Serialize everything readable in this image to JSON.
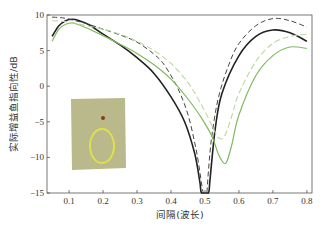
{
  "chart_data": {
    "type": "line",
    "title": "",
    "xlabel": "间隔(波长)",
    "ylabel": "实际增益鱼指向性/dB",
    "xlim": [
      0.035,
      0.815
    ],
    "ylim": [
      -15,
      10
    ],
    "xticks": [
      0.1,
      0.2,
      0.3,
      0.4,
      0.5,
      0.6,
      0.7,
      0.8
    ],
    "xtick_labels": [
      "0.1",
      "0.2",
      "0.3",
      "0.4",
      "0.5",
      "0.6",
      "0.7",
      "0.8"
    ],
    "yticks": [
      10,
      5,
      0,
      -5,
      -10,
      -15
    ],
    "ytick_labels": [
      "10",
      "5",
      "0",
      "−5",
      "−10",
      "−15"
    ],
    "grid": false,
    "legend": null,
    "series": [
      {
        "name": "black-solid",
        "color": "#222222",
        "dash": "",
        "width": 1.6,
        "x": [
          0.05,
          0.07,
          0.09,
          0.11,
          0.13,
          0.16,
          0.2,
          0.25,
          0.3,
          0.35,
          0.4,
          0.44,
          0.47,
          0.485,
          0.49,
          0.51,
          0.515,
          0.53,
          0.55,
          0.6,
          0.65,
          0.7,
          0.75,
          0.8
        ],
        "y": [
          7.0,
          8.5,
          9.2,
          9.4,
          9.2,
          8.6,
          7.3,
          5.8,
          4.0,
          1.8,
          -1.5,
          -5.0,
          -9.5,
          -13.5,
          -15,
          -15,
          -13,
          -6.0,
          -1.0,
          4.3,
          7.0,
          7.9,
          7.5,
          6.3
        ]
      },
      {
        "name": "black-dashed",
        "color": "#444444",
        "dash": "5,3",
        "width": 1.0,
        "x": [
          0.05,
          0.08,
          0.11,
          0.15,
          0.2,
          0.25,
          0.3,
          0.35,
          0.38,
          0.42,
          0.45,
          0.47,
          0.48,
          0.495,
          0.505,
          0.51,
          0.52,
          0.54,
          0.57,
          0.6,
          0.65,
          0.7,
          0.75,
          0.8
        ],
        "y": [
          9.7,
          9.6,
          9.3,
          8.8,
          8.0,
          7.2,
          6.2,
          4.5,
          3.0,
          -0.3,
          -4.0,
          -8.0,
          -10.5,
          -15,
          -15,
          -12,
          -7.0,
          -1.5,
          3.0,
          6.0,
          8.5,
          9.5,
          9.2,
          8.3
        ]
      },
      {
        "name": "green-solid",
        "color": "#7fba5c",
        "dash": "",
        "width": 1.2,
        "x": [
          0.05,
          0.07,
          0.09,
          0.11,
          0.13,
          0.16,
          0.2,
          0.25,
          0.3,
          0.35,
          0.4,
          0.45,
          0.49,
          0.52,
          0.54,
          0.555,
          0.565,
          0.58,
          0.6,
          0.65,
          0.7,
          0.75,
          0.8
        ],
        "y": [
          6.3,
          8.0,
          8.7,
          8.9,
          8.6,
          8.0,
          7.1,
          5.9,
          4.6,
          3.0,
          1.0,
          -1.8,
          -4.5,
          -7.0,
          -9.6,
          -10.8,
          -10.5,
          -8.0,
          -4.0,
          1.5,
          4.3,
          5.5,
          5.3
        ]
      },
      {
        "name": "green-dashed",
        "color": "#b9d9a3",
        "dash": "6,3",
        "width": 1.1,
        "x": [
          0.05,
          0.1,
          0.15,
          0.2,
          0.25,
          0.3,
          0.35,
          0.4,
          0.45,
          0.48,
          0.51,
          0.53,
          0.545,
          0.56,
          0.58,
          0.6,
          0.65,
          0.7,
          0.75,
          0.8
        ],
        "y": [
          9.2,
          9.0,
          8.5,
          8.0,
          7.3,
          6.3,
          5.0,
          3.2,
          0.5,
          -1.8,
          -4.5,
          -6.5,
          -7.4,
          -6.8,
          -4.0,
          -1.0,
          3.5,
          6.0,
          7.0,
          7.3
        ]
      }
    ],
    "inset": {
      "description": "antenna photo: loop on ground plane",
      "background": "#b9b98b",
      "ring_color": "#dfe04a",
      "feed_color": "#8a3b10"
    }
  }
}
